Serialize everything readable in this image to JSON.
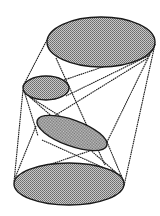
{
  "diagram": {
    "title": "Convex hull of four ellipses",
    "fill_pattern": "stipple-gray",
    "colors": {
      "stroke": "#1a1a1a",
      "fill_light": "#c8c8c8",
      "fill_dark": "#6a6a6a",
      "background": "#ffffff"
    },
    "ellipses": [
      {
        "name": "top-ellipse",
        "cx": 101,
        "cy": 42,
        "rx": 54,
        "ry": 25,
        "rotate": 0
      },
      {
        "name": "small-upper-left-ellipse",
        "cx": 46,
        "cy": 88,
        "rx": 23,
        "ry": 12,
        "rotate": 0
      },
      {
        "name": "middle-tilted-ellipse",
        "cx": 72,
        "cy": 133,
        "rx": 37,
        "ry": 13,
        "rotate": 20
      },
      {
        "name": "bottom-ellipse",
        "cx": 69,
        "cy": 184,
        "rx": 55,
        "ry": 21,
        "rotate": 0
      }
    ],
    "lines": [
      {
        "name": "hull-left-upper",
        "x1": 48,
        "y1": 38,
        "x2": 23,
        "y2": 86
      },
      {
        "name": "hull-left-lower",
        "x1": 23,
        "y1": 90,
        "x2": 14,
        "y2": 182
      },
      {
        "name": "hull-right",
        "x1": 155,
        "y1": 44,
        "x2": 124,
        "y2": 186
      },
      {
        "name": "top-right-to-middle",
        "x1": 155,
        "y1": 44,
        "x2": 107,
        "y2": 142
      },
      {
        "name": "top-right-to-small-a",
        "x1": 153,
        "y1": 50,
        "x2": 64,
        "y2": 80
      },
      {
        "name": "top-right-to-small-b",
        "x1": 150,
        "y1": 55,
        "x2": 66,
        "y2": 96
      },
      {
        "name": "top-right-to-middle-left",
        "x1": 148,
        "y1": 58,
        "x2": 38,
        "y2": 126
      },
      {
        "name": "top-left-to-bottom-cross",
        "x1": 56,
        "y1": 58,
        "x2": 105,
        "y2": 165
      },
      {
        "name": "small-to-middle-right",
        "x1": 30,
        "y1": 97,
        "x2": 105,
        "y2": 145
      },
      {
        "name": "small-left-to-middle-left",
        "x1": 25,
        "y1": 94,
        "x2": 38,
        "y2": 136
      },
      {
        "name": "small-left-to-bottom-right",
        "x1": 24,
        "y1": 92,
        "x2": 120,
        "y2": 176
      },
      {
        "name": "middle-left-to-bottom-left",
        "x1": 36,
        "y1": 126,
        "x2": 15,
        "y2": 178
      },
      {
        "name": "middle-left-to-bottom-right",
        "x1": 42,
        "y1": 140,
        "x2": 122,
        "y2": 176
      },
      {
        "name": "middle-right-to-bottom-left",
        "x1": 104,
        "y1": 146,
        "x2": 28,
        "y2": 172
      },
      {
        "name": "middle-right-to-bottom-right",
        "x1": 107,
        "y1": 142,
        "x2": 123,
        "y2": 180
      }
    ]
  }
}
